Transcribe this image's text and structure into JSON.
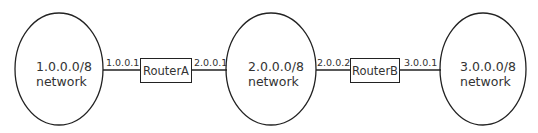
{
  "diagram": {
    "networks": [
      {
        "line1": "1.0.0.0/8",
        "line2": "network"
      },
      {
        "line1": "2.0.0.0/8",
        "line2": "network"
      },
      {
        "line1": "3.0.0.0/8",
        "line2": "network"
      }
    ],
    "routers": [
      {
        "label": "RouterA",
        "left_ip": "1.0.0.1",
        "right_ip": "2.0.0.1"
      },
      {
        "label": "RouterB",
        "left_ip": "2.0.0.2",
        "right_ip": "3.0.0.1"
      }
    ],
    "colors": {
      "stroke": "#222222",
      "text": "#333333",
      "background": "#ffffff"
    }
  }
}
